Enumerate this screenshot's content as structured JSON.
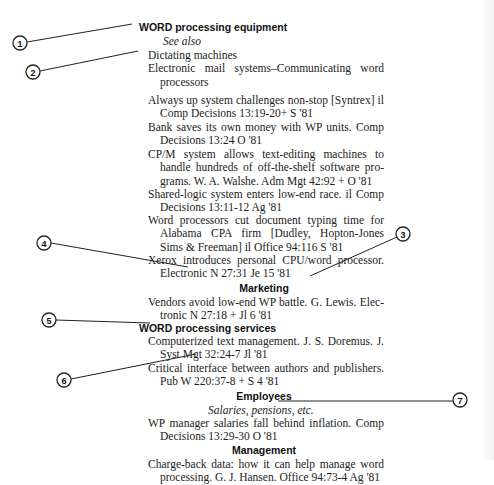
{
  "document": {
    "heading_equipment": "WORD processing equipment",
    "see_also_label": "See also",
    "see_also_items": [
      "Dictating machines",
      "Electronic mail systems–Communicating word",
      "processors"
    ],
    "entries": [
      {
        "lines": [
          "Always up system challenges non-stop [Syntrex] il",
          "Comp Decisions 13:19-20+ S '81"
        ]
      },
      {
        "lines": [
          "Bank saves its own money with WP units. Comp",
          "Decisions 13:24 O '81"
        ]
      },
      {
        "lines": [
          "CP/M system allows text-editing machines to",
          "handle hundreds of off-the-shelf software pro-",
          "grams. W. A. Walshe. Adm Mgt 42:92 + O '81"
        ]
      },
      {
        "lines": [
          "Shared-logic system enters low-end race. il Comp",
          "Decisions 13:11-12 Ag '81"
        ]
      },
      {
        "lines": [
          "Word processors cut document typing time for",
          "Alabama CPA firm [Dudley, Hopton-Jones",
          "Sims & Freeman] il Office 94:116 S '81"
        ]
      },
      {
        "lines": [
          "Xerox introduces personal CPU/word processor.",
          "Electronic N 27:31 Je 15 '81"
        ]
      }
    ],
    "subheading_marketing": "Marketing",
    "marketing_entries": [
      {
        "lines": [
          "Vendors avoid low-end WP battle. G. Lewis. Elec-",
          "tronic N 27:18 + Jl 6 '81"
        ]
      }
    ],
    "heading_services": "WORD processing services",
    "services_entries": [
      {
        "lines": [
          "Computerized text management. J. S. Doremus. J.",
          "Syst Mgt 32:24-7 Jl '81"
        ]
      },
      {
        "lines": [
          "Critical interface between authors and publishers.",
          "Pub W 220:37-8 + S 4 '81"
        ]
      }
    ],
    "subheading_employees": "Employees",
    "employees_see_also": "Salaries, pensions, etc.",
    "employees_entries": [
      {
        "lines": [
          "WP manager salaries fall behind inflation. Comp",
          "Decisions 13:29-30 O '81"
        ]
      }
    ],
    "subheading_management": "Management",
    "management_entries": [
      {
        "lines": [
          "Charge-back data: how it can help manage word",
          "processing. G. J. Hansen. Office 94:73-4 Ag '81"
        ]
      }
    ]
  },
  "callouts": [
    {
      "label": "1"
    },
    {
      "label": "2"
    },
    {
      "label": "3"
    },
    {
      "label": "4"
    },
    {
      "label": "5"
    },
    {
      "label": "6"
    },
    {
      "label": "7"
    }
  ]
}
